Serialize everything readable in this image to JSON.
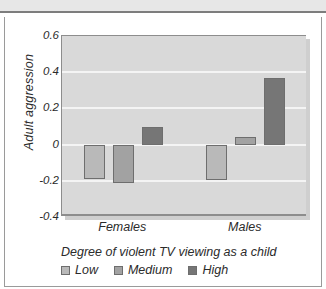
{
  "chart_data": {
    "type": "bar",
    "title": "",
    "xlabel": "",
    "ylabel": "Adult aggression",
    "categories": [
      "Females",
      "Males"
    ],
    "series": [
      {
        "name": "Low",
        "values": [
          -0.19,
          -0.195
        ],
        "color": "#b9b9b9"
      },
      {
        "name": "Medium",
        "values": [
          -0.21,
          0.04
        ],
        "color": "#a2a2a2"
      },
      {
        "name": "High",
        "values": [
          0.1,
          0.37
        ],
        "color": "#767676"
      }
    ],
    "ylim": [
      -0.4,
      0.6
    ],
    "yticks": [
      0.6,
      0.4,
      0.2,
      0,
      -0.2,
      -0.4
    ],
    "ytick_labels": [
      "0.6",
      "0.4",
      "0.2",
      "0",
      "-0.2",
      "-0.4"
    ],
    "grid": true,
    "legend_position": "bottom-left",
    "legend_title": "Degree of violent TV viewing as a child",
    "plot_background": "#d9d9d9",
    "gridline_color": "#f4f4f4"
  },
  "axis": {
    "y_title": "Adult aggression",
    "y_ticks": [
      {
        "label": "0.6",
        "value": 0.6
      },
      {
        "label": "0.4",
        "value": 0.4
      },
      {
        "label": "0.2",
        "value": 0.2
      },
      {
        "label": "0",
        "value": 0
      },
      {
        "label": "-0.2",
        "value": -0.2
      },
      {
        "label": "-0.4",
        "value": -0.4
      }
    ],
    "x_categories": [
      {
        "label": "Females"
      },
      {
        "label": "Males"
      }
    ]
  },
  "legend": {
    "title": "Degree of violent TV viewing as a child",
    "items": [
      {
        "label": "Low",
        "color": "#b9b9b9"
      },
      {
        "label": "Medium",
        "color": "#a2a2a2"
      },
      {
        "label": "High",
        "color": "#767676"
      }
    ]
  }
}
